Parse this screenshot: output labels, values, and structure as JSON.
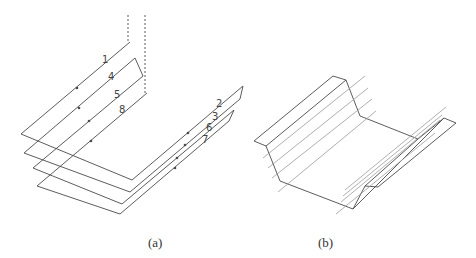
{
  "figure": {
    "panels": [
      {
        "id": "a",
        "caption": "(a)",
        "description": "Tool path passes around a U-shaped channel",
        "path_labels": [
          "1",
          "4",
          "5",
          "8",
          "2",
          "3",
          "6",
          "7"
        ]
      },
      {
        "id": "b",
        "caption": "(b)",
        "description": "Formed channel part with tool path lines"
      }
    ],
    "colors": {
      "line": "#4a4a4a",
      "light_line": "#9a9a9a",
      "caption": "#333333"
    }
  }
}
